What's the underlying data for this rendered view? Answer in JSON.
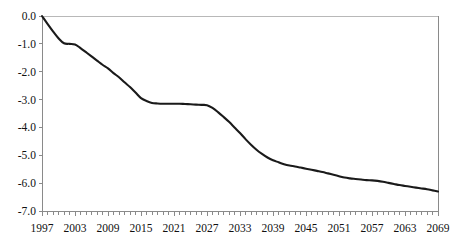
{
  "chart_data": {
    "type": "line",
    "title": "",
    "subtitle": "",
    "xlabel": "",
    "ylabel": "",
    "xlim": [
      1997,
      2069
    ],
    "ylim": [
      -7.0,
      0.0
    ],
    "grid": false,
    "legend": null,
    "legend_position": "none",
    "line_color": "#1a1a1a",
    "axis_color": "#8a8a8a",
    "background_color": "#ffffff",
    "y_ticks": [
      "0.0",
      "-1.0",
      "-2.0",
      "-3.0",
      "-4.0",
      "-5.0",
      "-6.0",
      "-7.0"
    ],
    "y_tick_values": [
      0.0,
      -1.0,
      -2.0,
      -3.0,
      -4.0,
      -5.0,
      -6.0,
      -7.0
    ],
    "x_tick_labels": [
      "1997",
      "2003",
      "2009",
      "2015",
      "2021",
      "2027",
      "2033",
      "2039",
      "2045",
      "2051",
      "2057",
      "2063",
      "2069"
    ],
    "x_tick_values": [
      1997,
      2003,
      2009,
      2015,
      2021,
      2027,
      2033,
      2039,
      2045,
      2051,
      2057,
      2063,
      2069
    ],
    "minor_tick_step": 1,
    "x": [
      1997,
      1998,
      1999,
      2000,
      2001,
      2002,
      2003,
      2004,
      2005,
      2006,
      2007,
      2008,
      2009,
      2010,
      2011,
      2012,
      2013,
      2014,
      2015,
      2016,
      2017,
      2018,
      2019,
      2020,
      2021,
      2022,
      2023,
      2024,
      2025,
      2026,
      2027,
      2028,
      2029,
      2030,
      2031,
      2032,
      2033,
      2034,
      2035,
      2036,
      2037,
      2038,
      2039,
      2040,
      2041,
      2042,
      2043,
      2044,
      2045,
      2046,
      2047,
      2048,
      2049,
      2050,
      2051,
      2052,
      2053,
      2054,
      2055,
      2056,
      2057,
      2058,
      2059,
      2060,
      2061,
      2062,
      2063,
      2064,
      2065,
      2066,
      2067,
      2068,
      2069
    ],
    "values": [
      0.0,
      -0.28,
      -0.55,
      -0.8,
      -0.98,
      -1.0,
      -1.02,
      -1.15,
      -1.3,
      -1.45,
      -1.6,
      -1.75,
      -1.88,
      -2.05,
      -2.2,
      -2.38,
      -2.55,
      -2.75,
      -2.95,
      -3.05,
      -3.12,
      -3.14,
      -3.15,
      -3.15,
      -3.15,
      -3.15,
      -3.16,
      -3.17,
      -3.18,
      -3.19,
      -3.2,
      -3.3,
      -3.45,
      -3.62,
      -3.8,
      -4.0,
      -4.2,
      -4.42,
      -4.62,
      -4.8,
      -4.95,
      -5.08,
      -5.18,
      -5.25,
      -5.32,
      -5.37,
      -5.4,
      -5.44,
      -5.48,
      -5.52,
      -5.56,
      -5.6,
      -5.65,
      -5.7,
      -5.75,
      -5.8,
      -5.83,
      -5.85,
      -5.87,
      -5.89,
      -5.9,
      -5.92,
      -5.95,
      -5.99,
      -6.03,
      -6.07,
      -6.1,
      -6.13,
      -6.16,
      -6.19,
      -6.22,
      -6.26,
      -6.3
    ],
    "series": [
      {
        "name": "",
        "values": [
          0.0,
          -0.28,
          -0.55,
          -0.8,
          -0.98,
          -1.0,
          -1.02,
          -1.15,
          -1.3,
          -1.45,
          -1.6,
          -1.75,
          -1.88,
          -2.05,
          -2.2,
          -2.38,
          -2.55,
          -2.75,
          -2.95,
          -3.05,
          -3.12,
          -3.14,
          -3.15,
          -3.15,
          -3.15,
          -3.15,
          -3.16,
          -3.17,
          -3.18,
          -3.19,
          -3.2,
          -3.3,
          -3.45,
          -3.62,
          -3.8,
          -4.0,
          -4.2,
          -4.42,
          -4.62,
          -4.8,
          -4.95,
          -5.08,
          -5.18,
          -5.25,
          -5.32,
          -5.37,
          -5.4,
          -5.44,
          -5.48,
          -5.52,
          -5.56,
          -5.6,
          -5.65,
          -5.7,
          -5.75,
          -5.8,
          -5.83,
          -5.85,
          -5.87,
          -5.89,
          -5.9,
          -5.92,
          -5.95,
          -5.99,
          -6.03,
          -6.07,
          -6.1,
          -6.13,
          -6.16,
          -6.19,
          -6.22,
          -6.26,
          -6.3
        ]
      }
    ]
  },
  "layout": {
    "plot_left": 42,
    "plot_right": 438,
    "plot_top": 16,
    "plot_bottom": 211
  }
}
